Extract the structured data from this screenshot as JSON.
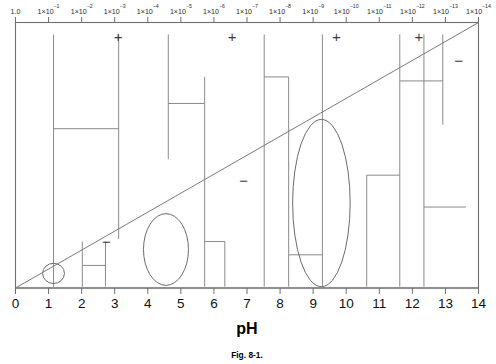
{
  "figure": {
    "caption": "Fig. 8-1.",
    "axis_title_bottom": "pH"
  },
  "chart_data": {
    "type": "scatter",
    "title": "",
    "subtitle": "",
    "xlabel": "pH",
    "ylabel": "",
    "xlim": [
      0,
      14
    ],
    "ylim": [
      0,
      1
    ],
    "grid": false,
    "legend": "none",
    "top_axis": {
      "label": "",
      "description": "hydrogen ion concentration (mol/L)",
      "tick_labels": [
        "1.0",
        "1×10⁻¹",
        "1×10⁻²",
        "1×10⁻³",
        "1×10⁻⁴",
        "1×10⁻⁵",
        "1×10⁻⁶",
        "1×10⁻⁷",
        "1×10⁻⁸",
        "1×10⁻⁹",
        "1×10⁻¹⁰",
        "1×10⁻¹¹",
        "1×10⁻¹²",
        "1×10⁻¹³",
        "1×10⁻¹⁴"
      ],
      "mantissa": "1×10",
      "exponents": [
        "",
        "-1",
        "-2",
        "-3",
        "-4",
        "-5",
        "-6",
        "-7",
        "-8",
        "-9",
        "-10",
        "-11",
        "-12",
        "-13",
        "-14"
      ],
      "values": [
        1.0,
        0.1,
        0.01,
        0.001,
        0.0001,
        1e-05,
        1e-06,
        1e-07,
        1e-08,
        1e-09,
        1e-10,
        1e-11,
        1e-12,
        1e-13,
        1e-14
      ]
    },
    "bottom_axis": {
      "label": "pH",
      "tick_labels": [
        "0",
        "1",
        "2",
        "3",
        "4",
        "5",
        "6",
        "7",
        "8",
        "9",
        "10",
        "11",
        "12",
        "13",
        "14"
      ],
      "values": [
        0,
        1,
        2,
        3,
        4,
        5,
        6,
        7,
        8,
        9,
        10,
        11,
        12,
        13,
        14
      ]
    },
    "diagonal": {
      "name": "pOH-reference-line",
      "x0": 0,
      "y0": 0,
      "x1": 14,
      "y1": 1
    },
    "signs": [
      {
        "symbol": "+",
        "x": 3.1,
        "y": 0.94
      },
      {
        "symbol": "+",
        "x": 6.55,
        "y": 0.94
      },
      {
        "symbol": "+",
        "x": 9.7,
        "y": 0.94
      },
      {
        "symbol": "+",
        "x": 12.2,
        "y": 0.94
      },
      {
        "symbol": "−",
        "x": 6.9,
        "y": 0.4
      },
      {
        "symbol": "−",
        "x": 2.75,
        "y": 0.17
      },
      {
        "symbol": "−",
        "x": 13.4,
        "y": 0.85
      }
    ],
    "blobs": [
      {
        "name": "small-circle",
        "cx": 1.15,
        "cy": 0.055,
        "rx": 0.33,
        "ry": 0.038
      },
      {
        "name": "medium-ellipse",
        "cx": 4.55,
        "cy": 0.145,
        "rx": 0.68,
        "ry": 0.135
      },
      {
        "name": "large-ellipse",
        "cx": 9.25,
        "cy": 0.32,
        "rx": 0.87,
        "ry": 0.315
      }
    ],
    "vertical_segments": [
      {
        "x": 1.15,
        "y_bottom": 0.005,
        "y_top": 0.955
      },
      {
        "x": 3.12,
        "y_bottom": 0.185,
        "y_top": 0.955
      },
      {
        "x": 2.02,
        "y_bottom": 0.005,
        "y_top": 0.175
      },
      {
        "x": 2.72,
        "y_bottom": 0.005,
        "y_top": 0.175
      },
      {
        "x": 4.62,
        "y_bottom": 0.485,
        "y_top": 0.955
      },
      {
        "x": 5.72,
        "y_bottom": 0.005,
        "y_top": 0.795
      },
      {
        "x": 6.33,
        "y_bottom": 0.005,
        "y_top": 0.175
      },
      {
        "x": 7.52,
        "y_bottom": 0.005,
        "y_top": 0.955
      },
      {
        "x": 8.26,
        "y_bottom": 0.005,
        "y_top": 0.795
      },
      {
        "x": 9.28,
        "y_bottom": 0.005,
        "y_top": 0.955
      },
      {
        "x": 10.62,
        "y_bottom": 0.005,
        "y_top": 0.425
      },
      {
        "x": 11.62,
        "y_bottom": 0.005,
        "y_top": 0.955
      },
      {
        "x": 12.35,
        "y_bottom": 0.005,
        "y_top": 0.955
      },
      {
        "x": 12.92,
        "y_bottom": 0.615,
        "y_top": 0.955
      }
    ],
    "horizontal_connectors": [
      {
        "x_left": 1.15,
        "x_right": 3.12,
        "y": 0.6
      },
      {
        "x_left": 2.02,
        "x_right": 2.72,
        "y": 0.085
      },
      {
        "x_left": 4.62,
        "x_right": 5.72,
        "y": 0.695
      },
      {
        "x_left": 5.72,
        "x_right": 6.33,
        "y": 0.175
      },
      {
        "x_left": 7.52,
        "x_right": 8.26,
        "y": 0.795
      },
      {
        "x_left": 8.26,
        "x_right": 9.28,
        "y": 0.125
      },
      {
        "x_left": 10.62,
        "x_right": 11.62,
        "y": 0.425
      },
      {
        "x_left": 11.62,
        "x_right": 12.92,
        "y": 0.78
      },
      {
        "x_left": 12.35,
        "x_right": 13.62,
        "y": 0.305
      }
    ]
  }
}
